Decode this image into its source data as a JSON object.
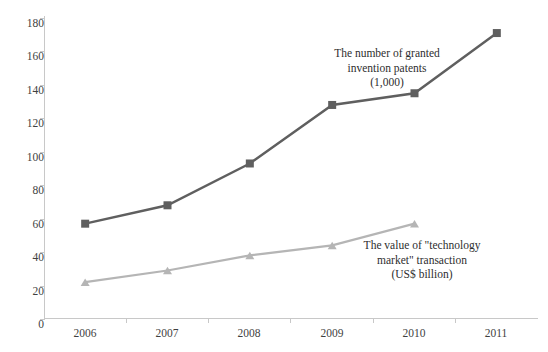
{
  "chart_data": {
    "type": "line",
    "title": "",
    "xlabel": "",
    "ylabel": "",
    "categories": [
      "2006",
      "2007",
      "2008",
      "2009",
      "2010",
      "2011"
    ],
    "x_tick_labels": [
      "2006",
      "2007",
      "2008",
      "2009",
      "2010",
      "2011"
    ],
    "y_tick_labels": [
      "0",
      "20",
      "40",
      "60",
      "80",
      "100",
      "120",
      "140",
      "160",
      "180"
    ],
    "y_ticks": [
      0,
      20,
      40,
      60,
      80,
      100,
      120,
      140,
      160,
      180
    ],
    "ylim": [
      0,
      180
    ],
    "grid": false,
    "legend": "annotations-inline",
    "series": [
      {
        "name": "The number of granted invention patents (1,000)",
        "marker": "square",
        "color": "#5f5f5f",
        "values": [
          57,
          68,
          93,
          128,
          135,
          171
        ]
      },
      {
        "name": "The value of \"technology market\" transaction (US$ billion)",
        "marker": "triangle",
        "color": "#b5b5b5",
        "values": [
          22,
          29,
          38,
          44,
          57,
          null
        ]
      }
    ],
    "annotations": [
      {
        "id": "patents",
        "text": "The number of granted\ninvention patents\n(1,000)"
      },
      {
        "id": "tech-market",
        "text": "The value of \"technology\nmarket\" transaction\n(US$ billion)"
      }
    ]
  },
  "axis": {
    "y_label_0": "0",
    "y_label_20": "20",
    "y_label_40": "40",
    "y_label_60": "60",
    "y_label_80": "80",
    "y_label_100": "100",
    "y_label_120": "120",
    "y_label_140": "140",
    "y_label_160": "160",
    "y_label_180": "180",
    "x_label_2006": "2006",
    "x_label_2007": "2007",
    "x_label_2008": "2008",
    "x_label_2009": "2009",
    "x_label_2010": "2010",
    "x_label_2011": "2011"
  },
  "colors": {
    "series_dark": "#5f5f5f",
    "series_light": "#b5b5b5",
    "axis": "#c8c8c8",
    "text": "#3a3a3a",
    "background": "#ffffff"
  }
}
